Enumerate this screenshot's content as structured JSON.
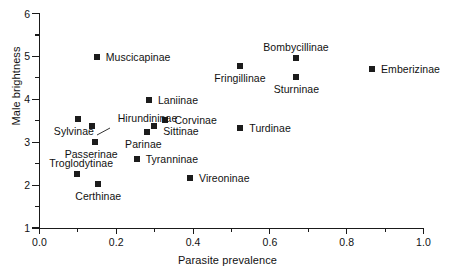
{
  "chart_data": {
    "type": "scatter",
    "title": "",
    "xlabel": "Parasite prevalence",
    "ylabel": "Male brightness",
    "xlim": [
      0.0,
      1.1
    ],
    "ylim": [
      1,
      6
    ],
    "grid": false,
    "legend": "none",
    "xticks": [
      "0.0",
      "0.2",
      "0.4",
      "0.6",
      "0.8",
      "1.0"
    ],
    "xtick_values": [
      0.0,
      0.2,
      0.4,
      0.6,
      0.8,
      1.0
    ],
    "xminor_values": [
      0.1,
      0.3,
      0.5,
      0.7,
      0.9,
      1.1
    ],
    "yticks": [
      "1",
      "2",
      "3",
      "4",
      "5",
      "6"
    ],
    "ytick_values": [
      1,
      2,
      3,
      4,
      5,
      6
    ],
    "yminor_values": [
      1.5,
      2.5,
      3.5,
      4.5,
      5.5
    ],
    "marker": "filled-square",
    "marker_color": "#1c1c1c",
    "points": [
      {
        "label": "Muscicapinae",
        "x": 0.149,
        "y": 4.99,
        "label_pos": "right"
      },
      {
        "label": "Bombycillinae",
        "x": 0.668,
        "y": 4.96,
        "label_pos": "above"
      },
      {
        "label": "Fringillinae",
        "x": 0.522,
        "y": 4.78,
        "label_pos": "below"
      },
      {
        "label": "Emberizinae",
        "x": 0.866,
        "y": 4.7,
        "label_pos": "right"
      },
      {
        "label": "Sturninae",
        "x": 0.669,
        "y": 4.51,
        "label_pos": "below"
      },
      {
        "label": "Laniinae",
        "x": 0.285,
        "y": 3.99,
        "label_pos": "right"
      },
      {
        "label": "Sylvinae",
        "x": 0.1,
        "y": 3.54,
        "label_pos": "below-left"
      },
      {
        "label": "Corvinae",
        "x": 0.328,
        "y": 3.52,
        "label_pos": "right"
      },
      {
        "label": "Hirundininae",
        "x": 0.136,
        "y": 3.37,
        "label_pos": "leader"
      },
      {
        "label": "Sittinae",
        "x": 0.299,
        "y": 3.37,
        "label_pos": "right-below"
      },
      {
        "label": "Turdinae",
        "x": 0.523,
        "y": 3.33,
        "label_pos": "right"
      },
      {
        "label": "Parinae",
        "x": 0.281,
        "y": 3.23,
        "label_pos": "below-left"
      },
      {
        "label": "Passerinae",
        "x": 0.145,
        "y": 3.01,
        "label_pos": "below-left"
      },
      {
        "label": "Tyranninae",
        "x": 0.253,
        "y": 2.6,
        "label_pos": "right"
      },
      {
        "label": "Troglodytinae",
        "x": 0.098,
        "y": 2.26,
        "label_pos": "above-left"
      },
      {
        "label": "Vireoninae",
        "x": 0.392,
        "y": 2.17,
        "label_pos": "right"
      },
      {
        "label": "Certhinae",
        "x": 0.153,
        "y": 2.02,
        "label_pos": "below"
      }
    ]
  }
}
